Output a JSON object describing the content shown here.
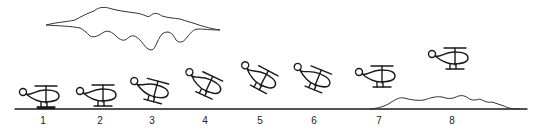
{
  "diagram": {
    "stages": [
      {
        "label": "1",
        "x": 43,
        "y": 100,
        "tilt": 0,
        "skid_ground": true
      },
      {
        "label": "2",
        "x": 100,
        "y": 98,
        "tilt": 0
      },
      {
        "label": "3",
        "x": 152,
        "y": 93,
        "tilt": 15
      },
      {
        "label": "4",
        "x": 205,
        "y": 86,
        "tilt": 25
      },
      {
        "label": "5",
        "x": 260,
        "y": 80,
        "tilt": 28
      },
      {
        "label": "6",
        "x": 314,
        "y": 80,
        "tilt": 22
      },
      {
        "label": "7",
        "x": 379,
        "y": 78,
        "tilt": 0
      },
      {
        "label": "8",
        "x": 452,
        "y": 60,
        "tilt": 0
      }
    ],
    "elements": {
      "cloud": "cloud-outline",
      "ground": "ground-line",
      "terrain": "hill-profile"
    },
    "colors": {
      "stroke": "#1a1a1a",
      "background": "#ffffff"
    }
  }
}
